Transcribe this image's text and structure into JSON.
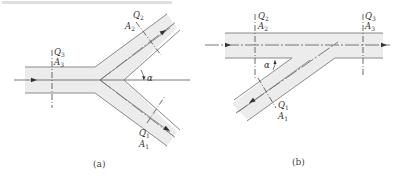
{
  "figure": {
    "top_cropped_text": "",
    "panels": [
      {
        "id": "a",
        "caption": "(a)",
        "caption_letter": "a",
        "type": "dividing-flow Y-junction",
        "labels": {
          "inlet_flow": "Q",
          "inlet_flow_sub": "3",
          "inlet_area": "A",
          "inlet_area_sub": "3",
          "upper_flow": "Q",
          "upper_flow_sub": "2",
          "upper_area": "A",
          "upper_area_sub": "2",
          "lower_flow": "Q",
          "lower_flow_sub": "1",
          "lower_area": "A",
          "lower_area_sub": "1",
          "angle": "α"
        }
      },
      {
        "id": "b",
        "caption": "(b)",
        "caption_letter": "b",
        "type": "combining-flow branch junction",
        "labels": {
          "main_inlet_flow": "Q",
          "main_inlet_flow_sub": "2",
          "main_inlet_area": "A",
          "main_inlet_area_sub": "2",
          "outlet_flow": "Q",
          "outlet_flow_sub": "3",
          "outlet_area": "A",
          "outlet_area_sub": "3",
          "branch_flow": "Q",
          "branch_flow_sub": "1",
          "branch_area": "A",
          "branch_area_sub": "1",
          "angle": "α"
        }
      }
    ],
    "colors": {
      "pipe_fill": "#ececec",
      "pipe_wall": "#8a8a8a",
      "line": "#6a6a6a",
      "text": "#333333"
    }
  }
}
